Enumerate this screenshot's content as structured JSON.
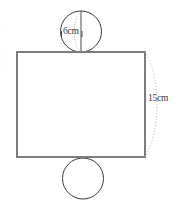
{
  "figure": {
    "kind": "cylinder-net-diagram",
    "background_color": "#ffffff",
    "rectangle": {
      "name": "lateral-surface-rectangle",
      "x": 17,
      "y": 52,
      "width": 128,
      "height": 105,
      "stroke_color": "#7d7d7d",
      "stroke_width": 2,
      "fill": "#ffffff"
    },
    "top_circle": {
      "name": "top-base-circle",
      "cx": 81,
      "cy": 31.5,
      "r": 20.5,
      "stroke_color": "#3a3a3a",
      "stroke_width": 1,
      "fill": "#ffffff"
    },
    "bottom_circle": {
      "name": "bottom-base-circle",
      "cx": 83,
      "cy": 178.5,
      "r": 20.5,
      "stroke_color": "#3a3a3a",
      "stroke_width": 1,
      "fill": "#ffffff"
    },
    "diameter_line": {
      "name": "top-circle-diameter-line",
      "x1": 81,
      "y1": 11,
      "x2": 81,
      "y2": 52,
      "stroke_color": "#4a4a4a",
      "stroke_width": 1
    },
    "diameter_arc": {
      "name": "top-circle-depth-arc",
      "stroke_color": "#b0b0b0",
      "stroke_width": 1,
      "dash": "1,2"
    },
    "height_arc": {
      "name": "rectangle-height-arc",
      "stroke_color": "#b5b5b5",
      "stroke_width": 1,
      "dash": "1,2"
    },
    "tick_marks": {
      "name": "diameter-tick-marks",
      "stroke_color": "#4a4a4a",
      "stroke_width": 1
    }
  },
  "labels": {
    "diameter": {
      "text": "6cm",
      "x": 63,
      "y": 34,
      "color": "#3a3a3a"
    },
    "height": {
      "text": "15cm",
      "x": 148,
      "y": 101,
      "color": "#3a3a3a"
    }
  },
  "edge_artifacts": {
    "note": "faint clipped glyph fragments along the far left margin",
    "marks": [
      {
        "text": "·",
        "x": 1,
        "y": 33
      },
      {
        "text": "·",
        "x": 1,
        "y": 52
      },
      {
        "text": "·",
        "x": 1,
        "y": 60
      },
      {
        "text": "·",
        "x": 1,
        "y": 68
      }
    ]
  }
}
